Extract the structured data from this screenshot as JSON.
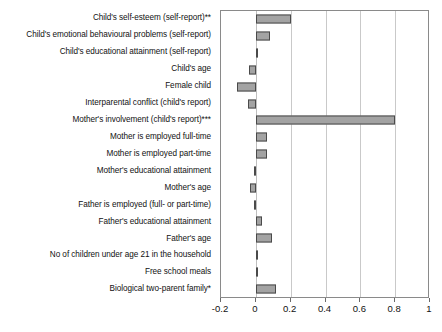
{
  "chart_data": {
    "type": "bar",
    "orientation": "horizontal",
    "title": "",
    "subtitle": "",
    "xlabel": "",
    "ylabel": "",
    "xlim": [
      -0.2,
      1.0
    ],
    "ylim": null,
    "grid": true,
    "legend": null,
    "legend_position": "none",
    "xticks": [
      -0.2,
      0,
      0.2,
      0.4,
      0.6,
      0.8,
      1
    ],
    "xtick_labels": [
      "-0.2",
      "0",
      "0.2",
      "0.4",
      "0.6",
      "0.8",
      "1"
    ],
    "bar_color": "#a3a3a3",
    "bar_edge_color": "#4a4a4a",
    "categories": [
      "Child's self-esteem (self-report)**",
      "Child's emotional behavioural problems (self-report)",
      "Child's educational attainment (self-report)",
      "Child's age",
      "Female child",
      "Interparental conflict (child's report)",
      "Mother's involvement (child's report)***",
      "Mother is employed full-time",
      "Mother is employed part-time",
      "Mother's educational attainment",
      "Mother's age",
      "Father is employed (full- or part-time)",
      "Father's educational attainment",
      "Father's age",
      "No of children under age 21 in the household",
      "Free school meals",
      "Biological two-parent family*"
    ],
    "values": [
      0.2,
      0.08,
      0.005,
      -0.04,
      -0.11,
      -0.045,
      0.8,
      0.065,
      0.065,
      -0.008,
      -0.035,
      -0.012,
      0.035,
      0.09,
      0.012,
      0.012,
      0.115
    ]
  }
}
